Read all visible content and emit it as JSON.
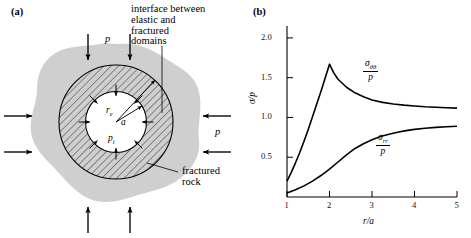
{
  "figure": {
    "panel_a": {
      "label": "(a)",
      "annotation_interface": "interface between\nelastic and\nfractured\ndomains",
      "annotation_fractured_rock": "fractured\nrock",
      "far_field_pressure_label": "p",
      "cavity_pressure_label": "p",
      "cavity_pressure_sub": "i",
      "outer_radius_label": "r",
      "outer_radius_sub": "e",
      "inner_radius_label": "a",
      "region_names": {
        "host_rock": "intact rock mass",
        "fractured_zone": "fractured domain",
        "cavity": "borehole cavity"
      },
      "colors": {
        "blob_fill": "#cfcfcf",
        "hatch_line": "#1a1a1a",
        "outline": "#000000"
      },
      "arrows": {
        "top_count": 2,
        "bottom_count": 2,
        "left_count": 2,
        "right_count": 2,
        "inner_radial_count": 8
      }
    },
    "panel_b": {
      "label": "(b)",
      "curve_label_hoop_num": "σ",
      "curve_label_hoop_sub": "θθ",
      "curve_label_hoop_den": "p",
      "curve_label_radial_num": "σ",
      "curve_label_radial_sub": "rr",
      "curve_label_radial_den": "p"
    }
  },
  "chart_data": {
    "type": "line",
    "title": "",
    "xlabel": "r/a",
    "ylabel": "σ/p",
    "xlim": [
      1,
      5
    ],
    "ylim": [
      0,
      2.15
    ],
    "xticks": [
      1,
      2,
      3,
      4,
      5
    ],
    "xtick_labels": [
      "1",
      "2",
      "3",
      "4",
      "5"
    ],
    "yticks": [
      0.5,
      1.0,
      1.5,
      2.0
    ],
    "ytick_labels": [
      "0.5",
      "1.0",
      "1.5",
      "2.0"
    ],
    "grid": false,
    "legend": "inline-annotations",
    "interface_x": 2,
    "series": [
      {
        "name": "σθθ/p",
        "label_position": {
          "x": 3.05,
          "y": 1.42
        },
        "x": [
          1.0,
          1.1,
          1.2,
          1.3,
          1.4,
          1.5,
          1.6,
          1.7,
          1.8,
          1.9,
          2.0,
          2.0,
          2.1,
          2.2,
          2.4,
          2.6,
          2.8,
          3.0,
          3.25,
          3.5,
          3.75,
          4.0,
          4.25,
          4.5,
          4.75,
          5.0
        ],
        "values": [
          0.2,
          0.31,
          0.43,
          0.56,
          0.7,
          0.85,
          1.01,
          1.17,
          1.33,
          1.5,
          1.67,
          1.67,
          1.56,
          1.48,
          1.38,
          1.31,
          1.26,
          1.22,
          1.19,
          1.17,
          1.155,
          1.145,
          1.135,
          1.128,
          1.122,
          1.118
        ]
      },
      {
        "name": "σrr/p",
        "label_position": {
          "x": 3.2,
          "y": 0.7
        },
        "x": [
          1.0,
          1.2,
          1.4,
          1.6,
          1.8,
          2.0,
          2.2,
          2.4,
          2.6,
          2.8,
          3.0,
          3.2,
          3.4,
          3.6,
          3.8,
          4.0,
          4.25,
          4.5,
          4.75,
          5.0
        ],
        "values": [
          0.05,
          0.09,
          0.14,
          0.2,
          0.27,
          0.35,
          0.44,
          0.53,
          0.61,
          0.67,
          0.72,
          0.76,
          0.79,
          0.815,
          0.835,
          0.85,
          0.865,
          0.875,
          0.883,
          0.89
        ]
      }
    ]
  }
}
